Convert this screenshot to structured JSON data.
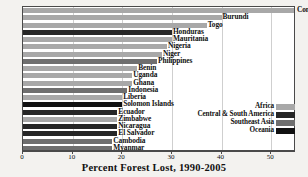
{
  "chart_data": {
    "type": "bar",
    "orientation": "horizontal",
    "title": "",
    "xlabel": "Percent Forest Lost, 1990-2005",
    "ylabel": "",
    "xlim": [
      0,
      55
    ],
    "xticks": [
      0,
      10,
      20,
      30,
      40,
      50
    ],
    "xtick_labels": [
      "0",
      "10",
      "20",
      "30",
      "40",
      "50"
    ],
    "grid": true,
    "legend_position": "lower-right",
    "categories": [
      "Comoros",
      "Burundi",
      "Togo",
      "Honduras",
      "Mauritania",
      "Nigeria",
      "Niger",
      "Philippines",
      "Benin",
      "Uganda",
      "Ghana",
      "Indonesia",
      "Liberia",
      "Solomon Islands",
      "Ecuador",
      "Zimbabwe",
      "Nicaragua",
      "El Salvador",
      "Cambodia",
      "Myanmar"
    ],
    "values": [
      55,
      40,
      37,
      30,
      30,
      29,
      28,
      27,
      23,
      22,
      22,
      21,
      20,
      20,
      19,
      19,
      19,
      19,
      18,
      18
    ],
    "series": [
      {
        "name": "Africa",
        "color": "#a8a8a8",
        "members": [
          "Comoros",
          "Burundi",
          "Togo",
          "Mauritania",
          "Nigeria",
          "Niger",
          "Benin",
          "Uganda",
          "Ghana",
          "Liberia",
          "Zimbabwe"
        ]
      },
      {
        "name": "Central & South America",
        "color": "#262626",
        "members": [
          "Honduras",
          "Ecuador",
          "Nicaragua",
          "El Salvador"
        ]
      },
      {
        "name": "Southeast Asia",
        "color": "#6f6f6f",
        "members": [
          "Philippines",
          "Indonesia",
          "Cambodia",
          "Myanmar"
        ]
      },
      {
        "name": "Oceania",
        "color": "#111111",
        "members": [
          "Solomon Islands"
        ]
      }
    ],
    "bars": [
      {
        "label": "Comoros",
        "value": 55,
        "region": "Africa",
        "color": "#a8a8a8",
        "label_outside": true
      },
      {
        "label": "Burundi",
        "value": 40,
        "region": "Africa",
        "color": "#a8a8a8",
        "label_outside": true
      },
      {
        "label": "Togo",
        "value": 37,
        "region": "Africa",
        "color": "#a8a8a8",
        "label_outside": true
      },
      {
        "label": "Honduras",
        "value": 30,
        "region": "Central & South America",
        "color": "#262626",
        "label_outside": true
      },
      {
        "label": "Mauritania",
        "value": 30,
        "region": "Africa",
        "color": "#a8a8a8",
        "label_outside": true
      },
      {
        "label": "Nigeria",
        "value": 29,
        "region": "Africa",
        "color": "#a8a8a8",
        "label_outside": true
      },
      {
        "label": "Niger",
        "value": 28,
        "region": "Africa",
        "color": "#a8a8a8",
        "label_outside": true
      },
      {
        "label": "Philippines",
        "value": 27,
        "region": "Southeast Asia",
        "color": "#6f6f6f",
        "label_outside": true
      },
      {
        "label": "Benin",
        "value": 23,
        "region": "Africa",
        "color": "#a8a8a8",
        "label_outside": true
      },
      {
        "label": "Uganda",
        "value": 22,
        "region": "Africa",
        "color": "#a8a8a8",
        "label_outside": true
      },
      {
        "label": "Ghana",
        "value": 22,
        "region": "Africa",
        "color": "#a8a8a8",
        "label_outside": true
      },
      {
        "label": "Indonesia",
        "value": 21,
        "region": "Southeast Asia",
        "color": "#6f6f6f",
        "label_outside": true
      },
      {
        "label": "Liberia",
        "value": 20,
        "region": "Africa",
        "color": "#a8a8a8",
        "label_outside": true
      },
      {
        "label": "Solomon Islands",
        "value": 20,
        "region": "Oceania",
        "color": "#111111",
        "label_outside": true
      },
      {
        "label": "Ecuador",
        "value": 19,
        "region": "Central & South America",
        "color": "#262626",
        "label_outside": true
      },
      {
        "label": "Zimbabwe",
        "value": 19,
        "region": "Africa",
        "color": "#a8a8a8",
        "label_outside": true
      },
      {
        "label": "Nicaragua",
        "value": 19,
        "region": "Central & South America",
        "color": "#262626",
        "label_outside": true
      },
      {
        "label": "El Salvador",
        "value": 19,
        "region": "Central & South America",
        "color": "#262626",
        "label_outside": true
      },
      {
        "label": "Cambodia",
        "value": 18,
        "region": "Southeast Asia",
        "color": "#6f6f6f",
        "label_outside": true
      },
      {
        "label": "Myanmar",
        "value": 18,
        "region": "Southeast Asia",
        "color": "#6f6f6f",
        "label_outside": true
      }
    ]
  },
  "legend": {
    "items": [
      {
        "label": "Africa",
        "color": "#a8a8a8"
      },
      {
        "label": "Central & South America",
        "color": "#262626"
      },
      {
        "label": "Southeast Asia",
        "color": "#6f6f6f"
      },
      {
        "label": "Oceania",
        "color": "#111111"
      }
    ]
  },
  "axis": {
    "title": "Percent Forest Lost, 1990-2005",
    "tick_labels": [
      "0",
      "10",
      "20",
      "30",
      "40",
      "50"
    ]
  }
}
